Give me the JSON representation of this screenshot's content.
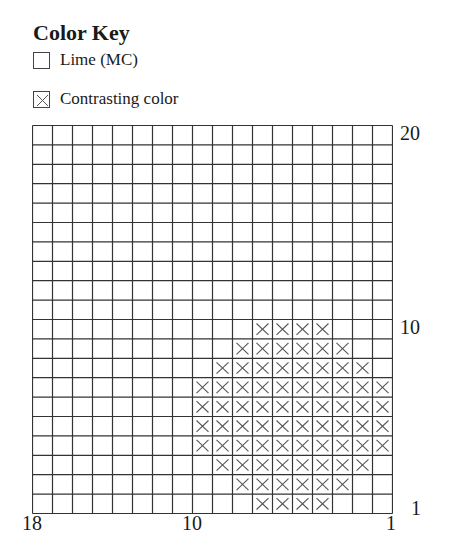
{
  "legend": {
    "title": "Color Key",
    "items": [
      {
        "symbol": "blank",
        "label": "Lime (MC)"
      },
      {
        "symbol": "x",
        "label": "Contrasting color"
      }
    ]
  },
  "grid": {
    "columns": 18,
    "rows": 20,
    "line_color": "#333333",
    "x_color": "#555555"
  },
  "axis": {
    "row_labels": [
      {
        "row": 20,
        "text": "20"
      },
      {
        "row": 10,
        "text": "10"
      },
      {
        "row": 1,
        "text": "1"
      }
    ],
    "col_labels": [
      {
        "col": 18,
        "text": "18"
      },
      {
        "col": 10,
        "text": "10"
      },
      {
        "col": 1,
        "text": "1"
      }
    ]
  },
  "chart_data": {
    "type": "table",
    "title": "Color Key",
    "columns": 18,
    "rows": 20,
    "legend": [
      {
        "symbol": "blank",
        "label": "Lime (MC)"
      },
      {
        "symbol": "x",
        "label": "Contrasting color"
      }
    ],
    "xlabels": [
      "18",
      "10",
      "1"
    ],
    "ylabels": [
      "20",
      "10",
      "1"
    ],
    "contrast_cells": [
      {
        "row": 1,
        "cols": [
          4,
          5,
          6,
          7
        ]
      },
      {
        "row": 2,
        "cols": [
          3,
          4,
          5,
          6,
          7,
          8
        ]
      },
      {
        "row": 3,
        "cols": [
          2,
          3,
          4,
          5,
          6,
          7,
          8,
          9
        ]
      },
      {
        "row": 4,
        "cols": [
          1,
          2,
          3,
          4,
          5,
          6,
          7,
          8,
          9,
          10
        ]
      },
      {
        "row": 5,
        "cols": [
          1,
          2,
          3,
          4,
          5,
          6,
          7,
          8,
          9,
          10
        ]
      },
      {
        "row": 6,
        "cols": [
          1,
          2,
          3,
          4,
          5,
          6,
          7,
          8,
          9,
          10
        ]
      },
      {
        "row": 7,
        "cols": [
          1,
          2,
          3,
          4,
          5,
          6,
          7,
          8,
          9,
          10
        ]
      },
      {
        "row": 8,
        "cols": [
          2,
          3,
          4,
          5,
          6,
          7,
          8,
          9
        ]
      },
      {
        "row": 9,
        "cols": [
          3,
          4,
          5,
          6,
          7,
          8
        ]
      },
      {
        "row": 10,
        "cols": [
          4,
          5,
          6,
          7
        ]
      }
    ]
  }
}
